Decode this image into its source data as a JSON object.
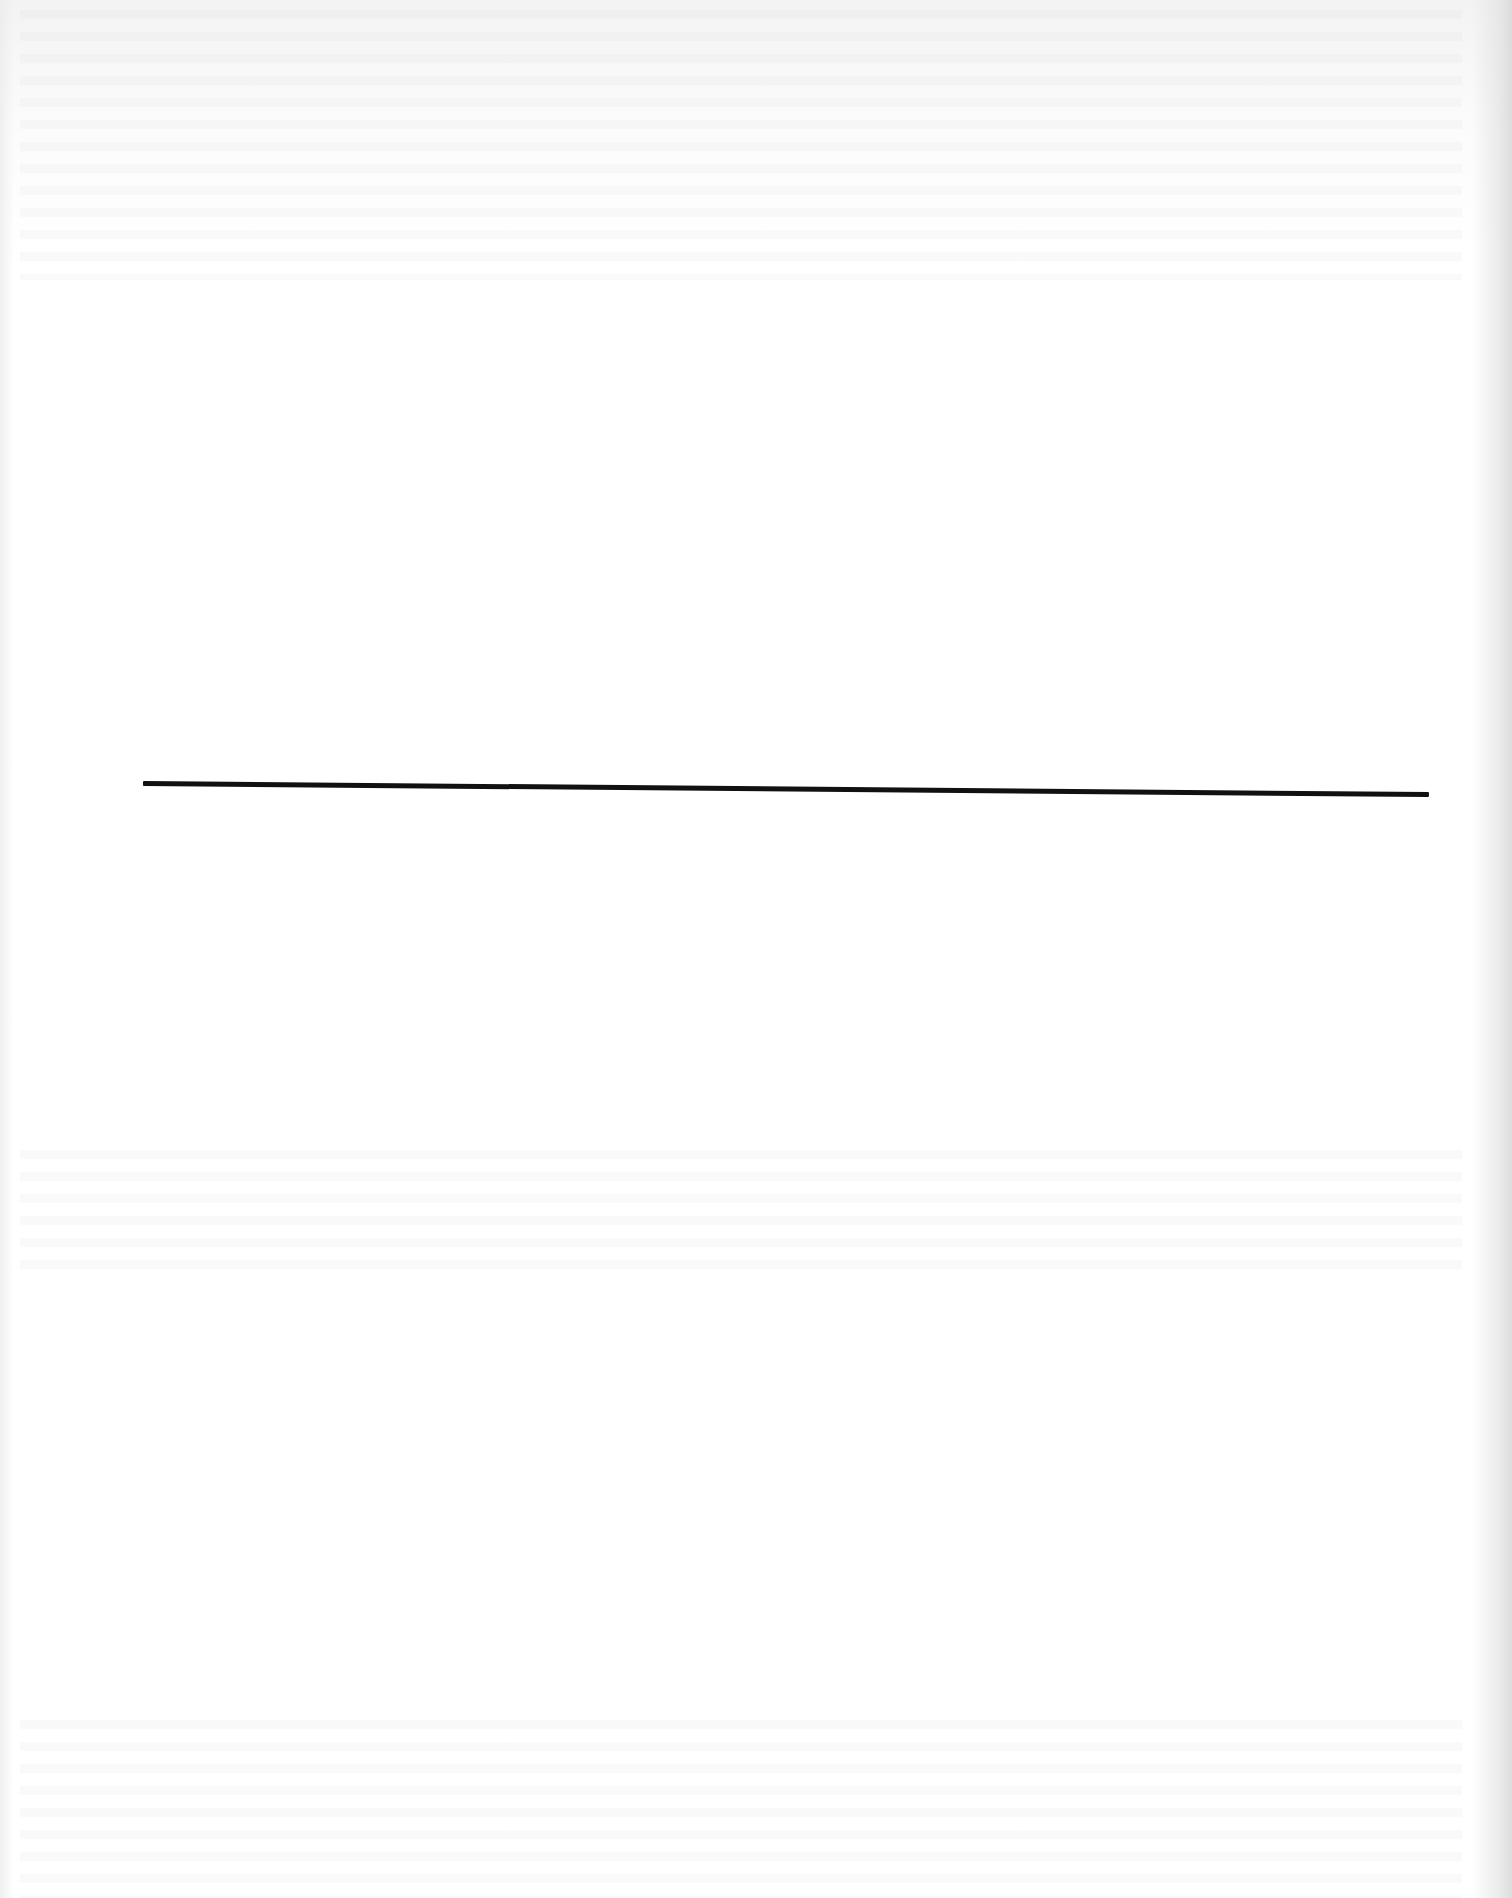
{
  "document": {
    "type": "scanned-page",
    "legible_text": [],
    "elements": [
      {
        "kind": "horizontal-rule",
        "color": "#111111"
      }
    ]
  },
  "colors": {
    "paper": "#ffffff",
    "rule": "#111111",
    "edge_shadow": "#d7d7d7"
  }
}
